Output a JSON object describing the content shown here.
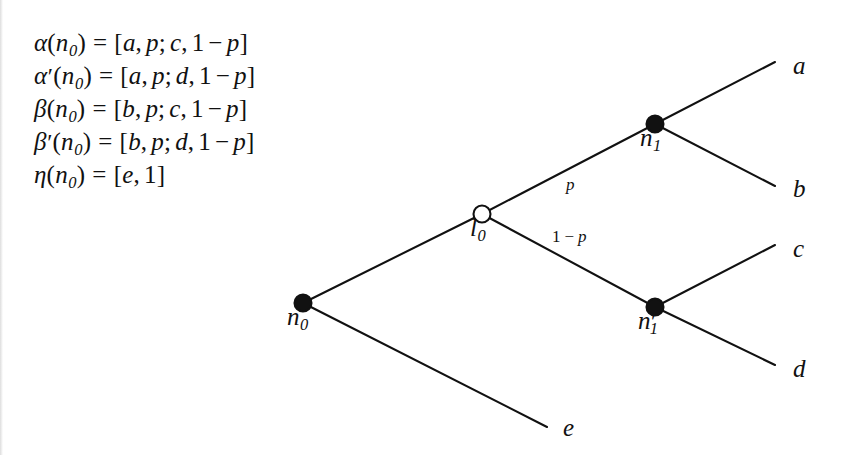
{
  "figure": {
    "type": "decision-tree-diagram",
    "background_color": "#ffffff",
    "ink_color": "#111111"
  },
  "formulas": {
    "lines": [
      {
        "id": "alpha",
        "text": "α(n₀) = [a, p; c, 1 − p]",
        "lhs_symbol": "α",
        "lhs_prime": "",
        "lhs_arg": "n",
        "lhs_arg_sub": "0",
        "equals": "=",
        "open": "[",
        "outcome1": "a",
        "prob1": "p",
        "semicolon": ";",
        "outcome2": "c",
        "prob2_one": "1",
        "prob2_minus": "−",
        "prob2_p": "p",
        "close": "]"
      },
      {
        "id": "alpha-prime",
        "text": "α′(n₀) = [a, p; d, 1 − p]",
        "lhs_symbol": "α",
        "lhs_prime": "′",
        "lhs_arg": "n",
        "lhs_arg_sub": "0",
        "equals": "=",
        "open": "[",
        "outcome1": "a",
        "prob1": "p",
        "semicolon": ";",
        "outcome2": "d",
        "prob2_one": "1",
        "prob2_minus": "−",
        "prob2_p": "p",
        "close": "]"
      },
      {
        "id": "beta",
        "text": "β(n₀) = [b, p; c, 1 − p]",
        "lhs_symbol": "β",
        "lhs_prime": "",
        "lhs_arg": "n",
        "lhs_arg_sub": "0",
        "equals": "=",
        "open": "[",
        "outcome1": "b",
        "prob1": "p",
        "semicolon": ";",
        "outcome2": "c",
        "prob2_one": "1",
        "prob2_minus": "−",
        "prob2_p": "p",
        "close": "]"
      },
      {
        "id": "beta-prime",
        "text": "β′(n₀) = [b, p; d, 1 − p]",
        "lhs_symbol": "β",
        "lhs_prime": "′",
        "lhs_arg": "n",
        "lhs_arg_sub": "0",
        "equals": "=",
        "open": "[",
        "outcome1": "b",
        "prob1": "p",
        "semicolon": ";",
        "outcome2": "d",
        "prob2_one": "1",
        "prob2_minus": "−",
        "prob2_p": "p",
        "close": "]"
      },
      {
        "id": "eta",
        "text": "η(n₀) = [e, 1]",
        "lhs_symbol": "η",
        "lhs_prime": "",
        "lhs_arg": "n",
        "lhs_arg_sub": "0",
        "equals": "=",
        "open": "[",
        "outcome1": "e",
        "prob1": "1",
        "close": "]"
      }
    ]
  },
  "tree": {
    "nodes": [
      {
        "id": "n0",
        "label": "n",
        "sub": "0",
        "prime": "",
        "kind": "decision",
        "filled": true,
        "x": 303,
        "y": 303,
        "r": 8.5,
        "label_x": 287,
        "label_y": 316
      },
      {
        "id": "l0",
        "label": "l",
        "sub": "0",
        "prime": "",
        "kind": "chance",
        "filled": false,
        "x": 482,
        "y": 214,
        "r": 8.5,
        "label_x": 468,
        "label_y": 227
      },
      {
        "id": "n1",
        "label": "n",
        "sub": "1",
        "prime": "",
        "kind": "decision",
        "filled": true,
        "x": 655,
        "y": 124,
        "r": 8.5,
        "label_x": 639,
        "label_y": 137
      },
      {
        "id": "n1p",
        "label": "n",
        "sub": "1",
        "prime": "′",
        "kind": "decision",
        "filled": true,
        "x": 655,
        "y": 307,
        "r": 8.5,
        "label_x": 639,
        "label_y": 320
      }
    ],
    "terminals": [
      {
        "id": "a",
        "label": "a",
        "x": 775,
        "y": 62,
        "label_x": 793,
        "label_y": 55
      },
      {
        "id": "b",
        "label": "b",
        "x": 775,
        "y": 186,
        "label_x": 793,
        "label_y": 178
      },
      {
        "id": "c",
        "label": "c",
        "x": 775,
        "y": 245,
        "label_x": 793,
        "label_y": 238
      },
      {
        "id": "d",
        "label": "d",
        "x": 775,
        "y": 365,
        "label_x": 793,
        "label_y": 357
      },
      {
        "id": "e",
        "label": "e",
        "x": 547,
        "y": 427,
        "label_x": 563,
        "label_y": 418
      }
    ],
    "edges": [
      {
        "id": "n0-l0",
        "from": "n0",
        "to": "l0",
        "x1": 303,
        "y1": 303,
        "x2": 482,
        "y2": 214,
        "label": ""
      },
      {
        "id": "n0-e",
        "from": "n0",
        "to": "e",
        "x1": 303,
        "y1": 303,
        "x2": 547,
        "y2": 427,
        "label": ""
      },
      {
        "id": "l0-n1",
        "from": "l0",
        "to": "n1",
        "x1": 482,
        "y1": 214,
        "x2": 655,
        "y2": 124,
        "label": "p"
      },
      {
        "id": "l0-n1p",
        "from": "l0",
        "to": "n1p",
        "x1": 482,
        "y1": 214,
        "x2": 655,
        "y2": 307,
        "label": "1 − p"
      },
      {
        "id": "n1-a",
        "from": "n1",
        "to": "a",
        "x1": 655,
        "y1": 124,
        "x2": 775,
        "y2": 62,
        "label": ""
      },
      {
        "id": "n1-b",
        "from": "n1",
        "to": "b",
        "x1": 655,
        "y1": 124,
        "x2": 775,
        "y2": 186,
        "label": ""
      },
      {
        "id": "n1p-c",
        "from": "n1p",
        "to": "c",
        "x1": 655,
        "y1": 307,
        "x2": 775,
        "y2": 245,
        "label": ""
      },
      {
        "id": "n1p-d",
        "from": "n1p",
        "to": "d",
        "x1": 655,
        "y1": 307,
        "x2": 775,
        "y2": 365,
        "label": ""
      }
    ],
    "edge_labels": [
      {
        "id": "prob-p",
        "one": "",
        "minus": "",
        "p": "p",
        "x": 566,
        "y": 175
      },
      {
        "id": "prob-1-p",
        "one": "1",
        "minus": "−",
        "p": "p",
        "x": 552,
        "y": 227
      }
    ]
  }
}
